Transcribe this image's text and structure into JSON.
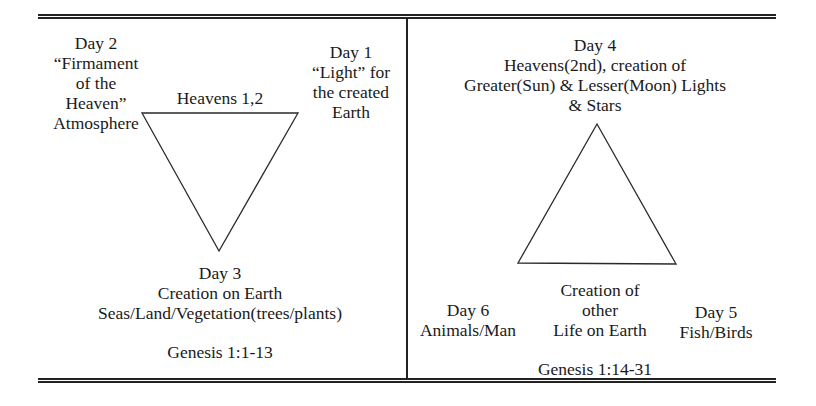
{
  "diagram": {
    "left_panel": {
      "day2": {
        "lines": [
          "Day 2",
          "“Firmament",
          "of the",
          "Heaven”",
          "Atmosphere"
        ]
      },
      "day1": {
        "lines": [
          "Day 1",
          "“Light” for",
          "the created",
          "Earth"
        ]
      },
      "triangle_label": "Heavens 1,2",
      "day3": {
        "lines": [
          "Day 3",
          "Creation on Earth",
          "Seas/Land/Vegetation(trees/plants)"
        ]
      },
      "reference": "Genesis 1:1-13",
      "triangle": {
        "orientation": "inverted",
        "points": [
          [
            142,
            113
          ],
          [
            298,
            113
          ],
          [
            219,
            251
          ]
        ]
      }
    },
    "right_panel": {
      "day4": {
        "lines": [
          "Day 4",
          "Heavens(2nd), creation of",
          "Greater(Sun) & Lesser(Moon) Lights",
          "& Stars"
        ]
      },
      "center_label": {
        "lines": [
          "Creation of",
          "other",
          "Life on Earth"
        ]
      },
      "day6": {
        "lines": [
          "Day 6",
          "Animals/Man"
        ]
      },
      "day5": {
        "lines": [
          "Day 5",
          "Fish/Birds"
        ]
      },
      "reference": "Genesis 1:14-31",
      "triangle": {
        "orientation": "upright",
        "points": [
          [
            597,
            124
          ],
          [
            518,
            263
          ],
          [
            676,
            264
          ]
        ]
      }
    },
    "colors": {
      "ink": "#1a1a1a",
      "background": "#ffffff"
    }
  }
}
